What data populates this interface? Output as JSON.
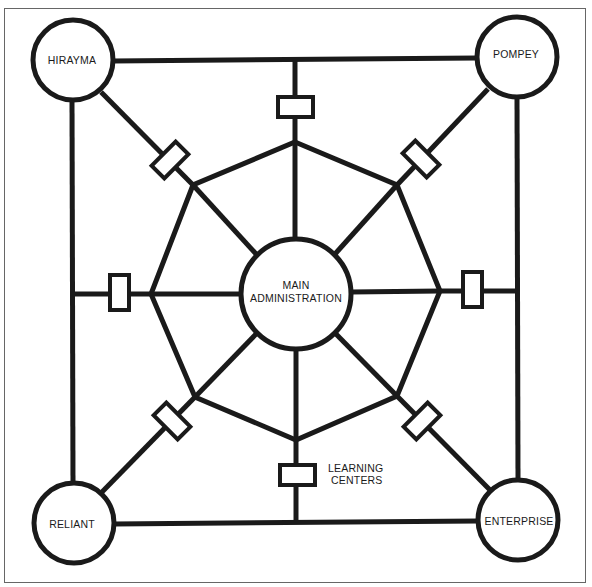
{
  "diagram": {
    "type": "network",
    "colors": {
      "stroke": "#1a1a1a",
      "background": "#ffffff",
      "frame": "#555555"
    },
    "nodes": {
      "center": {
        "label_line1": "MAIN",
        "label_line2": "ADMINISTRATION"
      },
      "top_left": {
        "label": "HIRAYMA"
      },
      "top_right": {
        "label": "POMPEY"
      },
      "bottom_left": {
        "label": "RELIANT"
      },
      "bottom_right": {
        "label": "ENTERPRISE"
      }
    },
    "annotation": {
      "line1": "LEARNING",
      "line2": "CENTERS"
    }
  }
}
